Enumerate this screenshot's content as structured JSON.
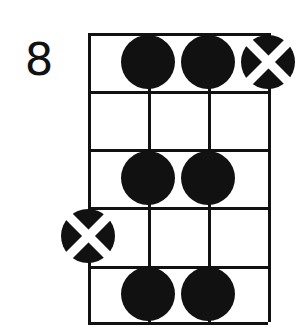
{
  "diagram": {
    "kind": "guitar-chord-diagram",
    "position_label": "8",
    "strings_count": 4,
    "frets_count": 5,
    "ink_color": "#111111",
    "background_color": "#ffffff",
    "grid": {
      "left": 88,
      "top": 33,
      "right": 268,
      "bottom": 322,
      "string_x": [
        88,
        148,
        208,
        268
      ],
      "fret_y": [
        33,
        91,
        149,
        207,
        266,
        322
      ]
    },
    "markers": [
      {
        "name": "dot-string2-fret1",
        "type": "dot",
        "string": 2,
        "fret": 1,
        "x": 148,
        "y": 62
      },
      {
        "name": "dot-string3-fret1",
        "type": "dot",
        "string": 3,
        "fret": 1,
        "x": 208,
        "y": 62
      },
      {
        "name": "cross-string4-fret1",
        "type": "cross",
        "string": 4,
        "fret": 1,
        "x": 268,
        "y": 62
      },
      {
        "name": "dot-string2-fret3",
        "type": "dot",
        "string": 2,
        "fret": 3,
        "x": 148,
        "y": 178
      },
      {
        "name": "dot-string3-fret3",
        "type": "dot",
        "string": 3,
        "fret": 3,
        "x": 208,
        "y": 178
      },
      {
        "name": "cross-string1-fret4",
        "type": "cross",
        "string": 1,
        "fret": 4,
        "x": 88,
        "y": 236
      },
      {
        "name": "dot-string2-fret5",
        "type": "dot",
        "string": 2,
        "fret": 5,
        "x": 148,
        "y": 294
      },
      {
        "name": "dot-string3-fret5",
        "type": "dot",
        "string": 3,
        "fret": 5,
        "x": 208,
        "y": 294
      }
    ]
  }
}
